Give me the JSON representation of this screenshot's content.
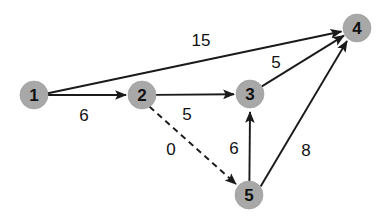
{
  "diagram": {
    "type": "directed-weighted-graph",
    "background_color": "#ffffff",
    "node_fill_color": "#a8a8a8",
    "edge_color": "#1a1a1a",
    "label_color": "#111111",
    "node_radius": 14,
    "nodes": [
      {
        "id": "1",
        "label": "1",
        "cx": 34,
        "cy": 95
      },
      {
        "id": "2",
        "label": "2",
        "cx": 142,
        "cy": 95
      },
      {
        "id": "3",
        "label": "3",
        "cx": 250,
        "cy": 94
      },
      {
        "id": "4",
        "label": "4",
        "cx": 357,
        "cy": 28
      },
      {
        "id": "5",
        "label": "5",
        "cx": 249,
        "cy": 195
      }
    ],
    "edges": [
      {
        "id": "e1-4",
        "from": "1",
        "to": "4",
        "weight": "15",
        "style": "solid",
        "label_x": 201,
        "label_y": 40
      },
      {
        "id": "e1-2",
        "from": "1",
        "to": "2",
        "weight": "6",
        "style": "solid",
        "label_x": 84,
        "label_y": 115
      },
      {
        "id": "e2-3",
        "from": "2",
        "to": "3",
        "weight": "5",
        "style": "solid",
        "label_x": 187,
        "label_y": 114
      },
      {
        "id": "e2-5",
        "from": "2",
        "to": "5",
        "weight": "0",
        "style": "dashed",
        "label_x": 171,
        "label_y": 149
      },
      {
        "id": "e3-4",
        "from": "3",
        "to": "4",
        "weight": "5",
        "style": "solid",
        "label_x": 276,
        "label_y": 62
      },
      {
        "id": "e5-3",
        "from": "5",
        "to": "3",
        "weight": "6",
        "style": "solid",
        "label_x": 234,
        "label_y": 148
      },
      {
        "id": "e5-4",
        "from": "5",
        "to": "4",
        "weight": "8",
        "style": "solid",
        "label_x": 306,
        "label_y": 150
      }
    ]
  }
}
